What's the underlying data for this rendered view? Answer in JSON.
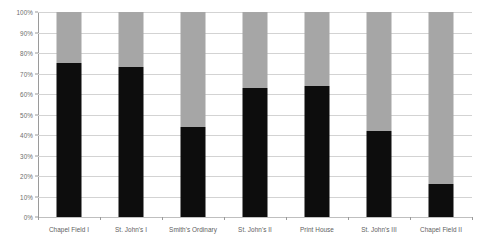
{
  "chart_data": {
    "type": "bar",
    "subtype": "stacked-percentage",
    "title": "",
    "subtitle": "",
    "xlabel": "",
    "ylabel": "",
    "ylim": [
      0,
      100
    ],
    "grid": true,
    "legend": "none",
    "categories": [
      "Chapel Field I",
      "St. John's I",
      "Smith's Ordinary",
      "St. John's II",
      "Print House",
      "St. John's III",
      "Chapel Field II"
    ],
    "ytick_labels": [
      "100%",
      "90%",
      "80%",
      "70%",
      "60%",
      "50%",
      "40%",
      "30%",
      "20%",
      "10%",
      "0%"
    ],
    "ytick_values": [
      100,
      90,
      80,
      70,
      60,
      50,
      40,
      30,
      20,
      10,
      0
    ],
    "series": [
      {
        "name": "lower-segment",
        "color": "#0d0d0d",
        "values": [
          75,
          73,
          44,
          63,
          64,
          42,
          16
        ]
      },
      {
        "name": "upper-segment",
        "color": "#a6a6a6",
        "values": [
          25,
          27,
          56,
          37,
          36,
          58,
          84
        ]
      }
    ]
  },
  "colors": {
    "background": "#ffffff",
    "dark_segment": "#0d0d0d",
    "light_segment": "#a6a6a6",
    "gridline": "#d3d3d3",
    "axis": "#9a9a9a",
    "tick_text": "#6d6d6d",
    "category_text": "#5e5e5e"
  }
}
